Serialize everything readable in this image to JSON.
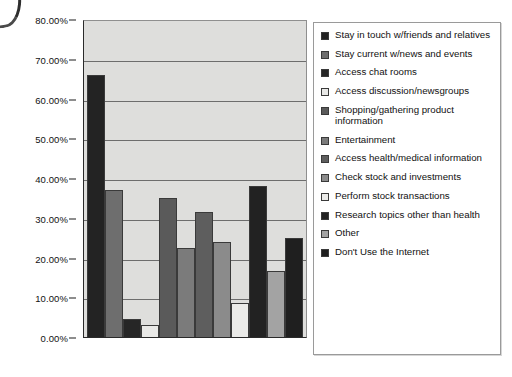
{
  "chart_data": {
    "type": "bar",
    "title": "",
    "subtitle": "",
    "xlabel": "",
    "ylabel": "",
    "ylim": [
      0,
      80
    ],
    "y_tick_format": "percent-2dp",
    "grid": true,
    "x_tick_labels_visible": false,
    "legend_position": "right",
    "plot_background": "#dededc",
    "categories": [
      "Stay in touch w/friends and relatives",
      "Stay current w/news and events",
      "Access chat rooms",
      "Access discussion/newsgroups",
      "Shopping/gathering product information",
      "Entertainment",
      "Access health/medical information",
      "Check stock and investments",
      "Perform stock transactions",
      "Research topics other than health",
      "Other",
      "Don't Use the Internet"
    ],
    "values": [
      66.0,
      37.0,
      4.5,
      3.0,
      35.0,
      22.5,
      31.5,
      24.0,
      8.5,
      38.0,
      16.5,
      25.0
    ],
    "value_labels": [
      "66.00%",
      "37.00%",
      "4.50%",
      "3.00%",
      "35.00%",
      "22.50%",
      "31.50%",
      "24.00%",
      "8.50%",
      "38.00%",
      "16.50%",
      "25.00%"
    ],
    "colors": [
      "#232323",
      "#6e6e6e",
      "#262626",
      "#e8e8e6",
      "#5a5a5a",
      "#7b7b7b",
      "#5e5e5e",
      "#8b8b8b",
      "#ebebe9",
      "#222222",
      "#a3a3a3",
      "#1f1f1f"
    ],
    "yticks": [
      0,
      10,
      20,
      30,
      40,
      50,
      60,
      70,
      80
    ],
    "ytick_labels": [
      "0.00%",
      "10.00%",
      "20.00%",
      "30.00%",
      "40.00%",
      "50.00%",
      "60.00%",
      "70.00%",
      "80.00%"
    ]
  },
  "legend": {
    "items": [
      {
        "label": "Stay in touch w/friends and relatives",
        "color": "#232323"
      },
      {
        "label": "Stay current w/news and events",
        "color": "#6e6e6e"
      },
      {
        "label": "Access chat rooms",
        "color": "#262626"
      },
      {
        "label": "Access discussion/newsgroups",
        "color": "#e8e8e6"
      },
      {
        "label": "Shopping/gathering product information",
        "color": "#5a5a5a"
      },
      {
        "label": "Entertainment",
        "color": "#7b7b7b"
      },
      {
        "label": "Access health/medical information",
        "color": "#5e5e5e"
      },
      {
        "label": "Check stock and investments",
        "color": "#8b8b8b"
      },
      {
        "label": "Perform stock transactions",
        "color": "#ebebe9"
      },
      {
        "label": "Research topics other than health",
        "color": "#222222"
      },
      {
        "label": "Other",
        "color": "#a3a3a3"
      },
      {
        "label": "Don't Use the Internet",
        "color": "#1f1f1f"
      }
    ]
  }
}
